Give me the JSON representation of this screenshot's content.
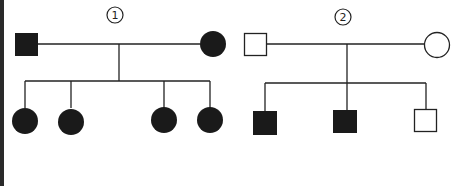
{
  "diagram": {
    "type": "pedigree",
    "colors": {
      "affected": "#1a1a1a",
      "unaffected": "#ffffff",
      "line": "#222222",
      "border": "#2a2a2a"
    },
    "families": [
      {
        "label": "1",
        "parents": [
          {
            "sex": "male",
            "affected": true
          },
          {
            "sex": "female",
            "affected": true
          }
        ],
        "children": [
          {
            "sex": "female",
            "affected": true
          },
          {
            "sex": "female",
            "affected": true
          },
          {
            "sex": "female",
            "affected": true
          },
          {
            "sex": "female",
            "affected": true
          }
        ]
      },
      {
        "label": "2",
        "parents": [
          {
            "sex": "male",
            "affected": false
          },
          {
            "sex": "female",
            "affected": false
          }
        ],
        "children": [
          {
            "sex": "male",
            "affected": true
          },
          {
            "sex": "male",
            "affected": true
          },
          {
            "sex": "male",
            "affected": false
          }
        ]
      }
    ]
  }
}
